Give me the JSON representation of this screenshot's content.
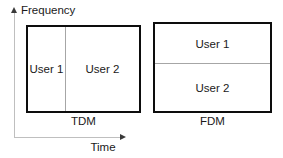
{
  "diagram": {
    "axes": {
      "y_label": "Frequency",
      "x_label": "Time",
      "y_arrow_icon": "arrow-up-icon",
      "x_arrow_icon": "arrow-right-icon"
    },
    "panels": [
      {
        "id": "tdm",
        "caption": "TDM",
        "split": "vertical",
        "cells": [
          {
            "label": "User 1"
          },
          {
            "label": "User 2"
          }
        ]
      },
      {
        "id": "fdm",
        "caption": "FDM",
        "split": "horizontal",
        "cells": [
          {
            "label": "User 1"
          },
          {
            "label": "User 2"
          }
        ]
      }
    ]
  },
  "colors": {
    "background": "#ffffff",
    "box_border": "#0d0d0d",
    "divider": "#a6a6a6",
    "axis_line": "#bfbfbf",
    "arrow": "#3a3a3a",
    "text": "#1a1a1a"
  }
}
